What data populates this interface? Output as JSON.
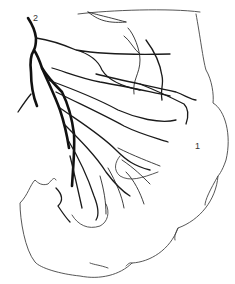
{
  "figure": {
    "type": "anatomical line drawing",
    "labels": [
      {
        "id": "label-2",
        "text": "2",
        "x": 36,
        "y": 18
      },
      {
        "id": "label-1",
        "text": "1",
        "x": 196,
        "y": 144
      }
    ],
    "colors": {
      "background": "#ffffff",
      "vessel": "#111111",
      "outline": "#444444"
    }
  }
}
